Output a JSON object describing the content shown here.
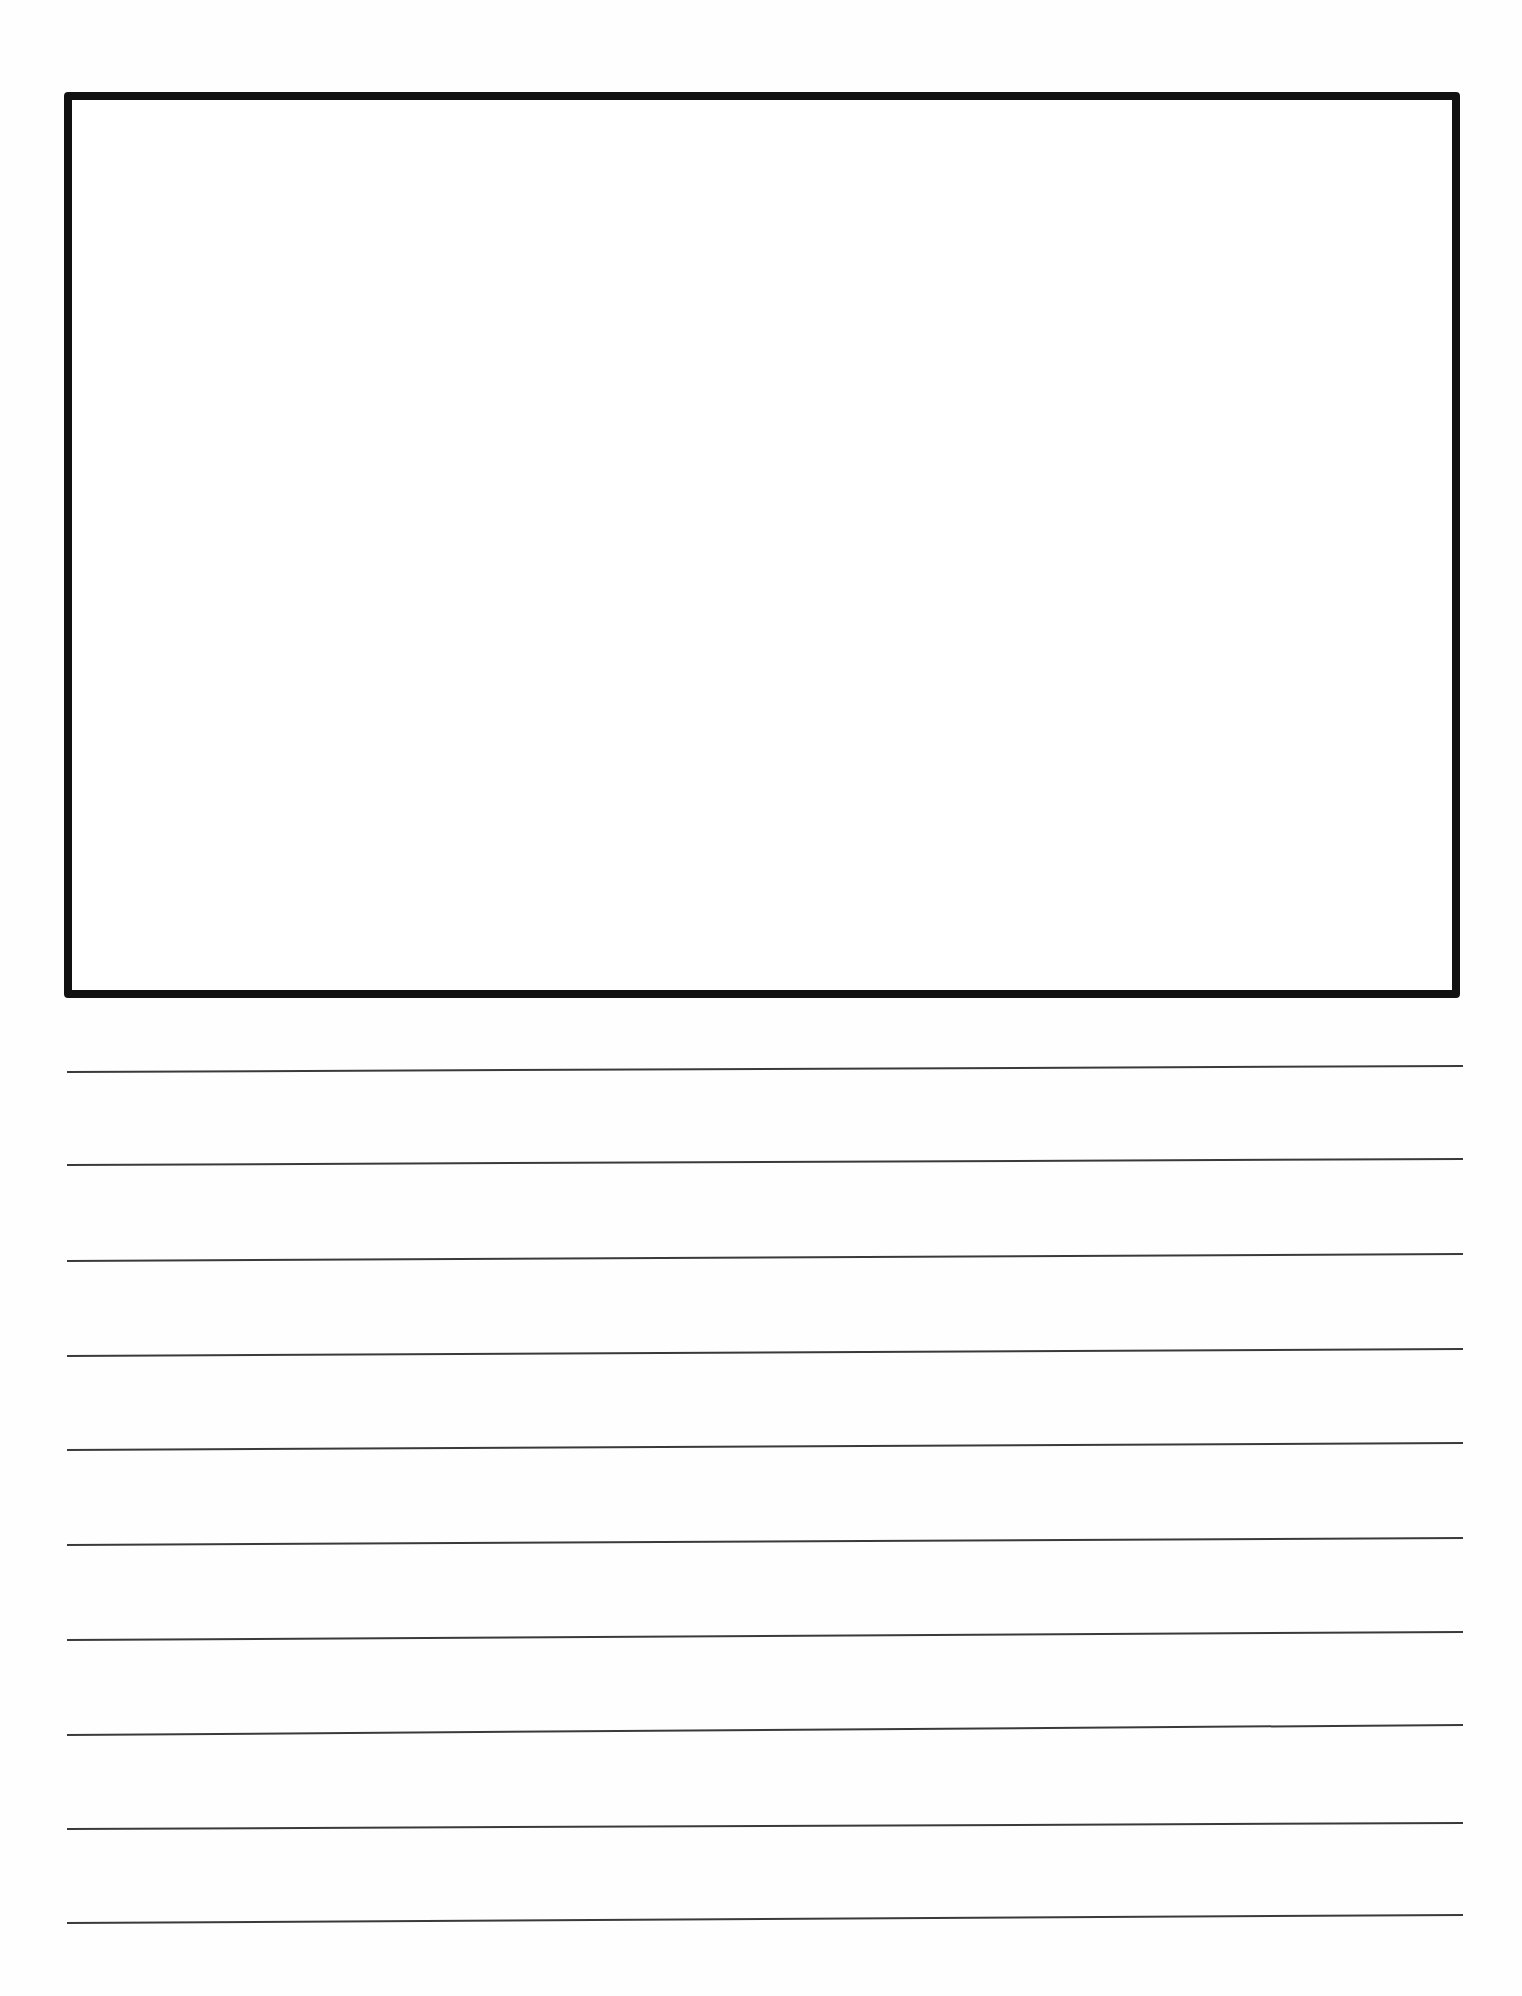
{
  "page": {
    "type": "drawing-and-writing-template",
    "background_color": "#ffffff",
    "ink_color": "#111111",
    "line_color": "#3a3a3a"
  },
  "drawing_box": {
    "label": "",
    "x": 64,
    "y": 92,
    "width": 1396,
    "height": 906,
    "border_width": 8
  },
  "writing_lines": {
    "count": 10,
    "x_start": 67,
    "x_end": 1463,
    "stroke_width": 2,
    "left_y": [
      1072,
      1165,
      1261,
      1356,
      1450,
      1545,
      1640,
      1735,
      1829,
      1923
    ],
    "right_y": [
      1066,
      1159,
      1254,
      1349,
      1443,
      1538,
      1632,
      1725,
      1823,
      1915
    ]
  }
}
